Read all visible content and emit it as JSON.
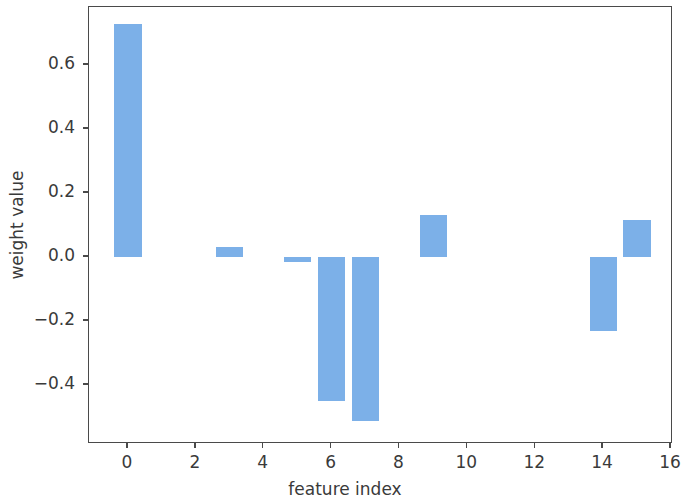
{
  "chart_data": {
    "type": "bar",
    "title": "",
    "xlabel": "feature index",
    "ylabel": "weight value",
    "categories": [
      0,
      1,
      2,
      3,
      4,
      5,
      6,
      7,
      8,
      9,
      10,
      11,
      12,
      13,
      14,
      15
    ],
    "values": [
      0.728,
      0.0,
      0.0,
      0.031,
      0.0,
      -0.015,
      -0.45,
      -0.513,
      0.0,
      0.131,
      0.0,
      0.0,
      0.0,
      0.0,
      -0.232,
      0.116
    ],
    "xlim": [
      -1.15,
      16.06
    ],
    "ylim": [
      -0.585,
      0.781
    ],
    "xticks": [
      0,
      2,
      4,
      6,
      8,
      10,
      12,
      14,
      16
    ],
    "xtick_labels": [
      "0",
      "2",
      "4",
      "6",
      "8",
      "10",
      "12",
      "14",
      "16"
    ],
    "yticks": [
      0.6,
      0.4,
      0.2,
      0.0,
      -0.2,
      -0.4
    ],
    "ytick_labels": [
      "0.6",
      "0.4",
      "0.2",
      "0.0",
      "−0.2",
      "−0.4"
    ],
    "bar_color": "#7cb0e8",
    "bar_width": 0.8,
    "grid": false,
    "legend": null,
    "axis_color": "#4a4a4a",
    "background": "#ffffff"
  },
  "figure": {
    "width": 690,
    "height": 493,
    "plot_left": 88,
    "plot_top": 6,
    "plot_right": 672,
    "plot_bottom": 443
  }
}
